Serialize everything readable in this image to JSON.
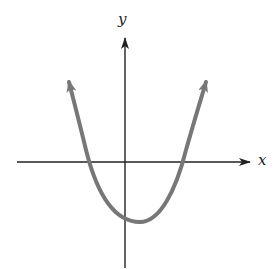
{
  "diagram": {
    "type": "graph-of-function",
    "axes": {
      "x_label": "x",
      "y_label": "y",
      "x_axis": {
        "x1": 17,
        "x2": 250,
        "y": 162
      },
      "y_axis": {
        "x": 125,
        "y1": 38,
        "y2": 268
      },
      "color": "#222222"
    },
    "curve": {
      "shape": "parabola",
      "opens": "up",
      "color": "#777777",
      "stroke_width": 4,
      "left_end": {
        "x": 69,
        "y": 82
      },
      "right_end": {
        "x": 206,
        "y": 82
      },
      "x_intercepts": [
        {
          "x": 93,
          "y": 162
        },
        {
          "x": 183,
          "y": 162
        }
      ],
      "y_intercept": {
        "x": 125,
        "y": 217
      },
      "vertex": {
        "x": 140,
        "y": 222
      },
      "arrows_at_ends": true,
      "qualitative": {
        "x_intercept_count": 2,
        "x_intercept_signs": [
          "negative",
          "positive"
        ],
        "y_intercept_sign": "negative",
        "vertex_quadrant": "IV"
      }
    }
  }
}
